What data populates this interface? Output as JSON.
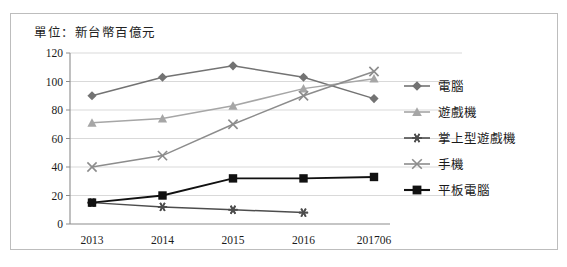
{
  "unit_label": "單位：新台幣百億元",
  "axis": {
    "y_ticks": [
      "0",
      "20",
      "40",
      "60",
      "80",
      "100",
      "120"
    ],
    "x_ticks": [
      "2013",
      "2014",
      "2015",
      "2016",
      "201706"
    ]
  },
  "legend": {
    "items": [
      {
        "label": "電腦",
        "marker": "diamond-marker",
        "color": "#737373"
      },
      {
        "label": "遊戲機",
        "marker": "triangle-marker",
        "color": "#a6a6a6"
      },
      {
        "label": "掌上型遊戲機",
        "marker": "asterisk-marker",
        "color": "#4d4d4d"
      },
      {
        "label": "手機",
        "marker": "x-marker",
        "color": "#8c8c8c"
      },
      {
        "label": "平板電腦",
        "marker": "square-marker",
        "color": "#111111"
      }
    ]
  },
  "chart_data": {
    "type": "line",
    "title": "單位：新台幣百億元",
    "xlabel": "",
    "ylabel": "",
    "ylim": [
      0,
      120
    ],
    "ytick_step": 20,
    "grid": true,
    "legend_position": "right",
    "categories": [
      "2013",
      "2014",
      "2015",
      "2016",
      "201706"
    ],
    "series": [
      {
        "name": "電腦",
        "marker": "diamond",
        "color": "#737373",
        "values": [
          90,
          103,
          111,
          103,
          88
        ]
      },
      {
        "name": "遊戲機",
        "marker": "triangle",
        "color": "#a6a6a6",
        "values": [
          71,
          74,
          83,
          95,
          102
        ]
      },
      {
        "name": "掌上型遊戲機",
        "marker": "asterisk",
        "color": "#4d4d4d",
        "values": [
          15,
          12,
          10,
          8,
          null
        ]
      },
      {
        "name": "手機",
        "marker": "x",
        "color": "#8c8c8c",
        "values": [
          40,
          48,
          70,
          90,
          107
        ]
      },
      {
        "name": "平板電腦",
        "marker": "square",
        "color": "#111111",
        "values": [
          15,
          20,
          32,
          32,
          33
        ]
      }
    ]
  }
}
